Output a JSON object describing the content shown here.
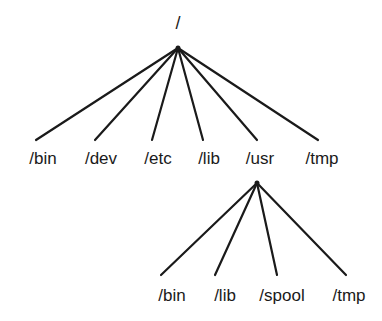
{
  "diagram": {
    "type": "directory-tree",
    "root": {
      "label": "/",
      "x": 178,
      "y": 48,
      "label_x": 178,
      "label_y": 14
    },
    "level1": [
      {
        "label": "/bin",
        "line_end_x": 36,
        "line_end_y": 140,
        "label_x": 43,
        "label_y": 150
      },
      {
        "label": "/dev",
        "line_end_x": 95,
        "line_end_y": 140,
        "label_x": 101,
        "label_y": 150
      },
      {
        "label": "/etc",
        "line_end_x": 152,
        "line_end_y": 140,
        "label_x": 158,
        "label_y": 150
      },
      {
        "label": "/lib",
        "line_end_x": 203,
        "line_end_y": 140,
        "label_x": 209,
        "label_y": 150
      },
      {
        "label": "/usr",
        "line_end_x": 257,
        "line_end_y": 140,
        "label_x": 260,
        "label_y": 150
      },
      {
        "label": "/tmp",
        "line_end_x": 318,
        "line_end_y": 140,
        "label_x": 322,
        "label_y": 150
      }
    ],
    "usr_subtree": {
      "parent": "/usr",
      "x": 257,
      "y": 183,
      "children": [
        {
          "label": "/bin",
          "line_end_x": 161,
          "line_end_y": 275,
          "label_x": 172,
          "label_y": 287
        },
        {
          "label": "/lib",
          "line_end_x": 215,
          "line_end_y": 275,
          "label_x": 225,
          "label_y": 287
        },
        {
          "label": "/spool",
          "line_end_x": 277,
          "line_end_y": 275,
          "label_x": 282,
          "label_y": 287
        },
        {
          "label": "/tmp",
          "line_end_x": 346,
          "line_end_y": 275,
          "label_x": 349,
          "label_y": 287
        }
      ]
    }
  }
}
